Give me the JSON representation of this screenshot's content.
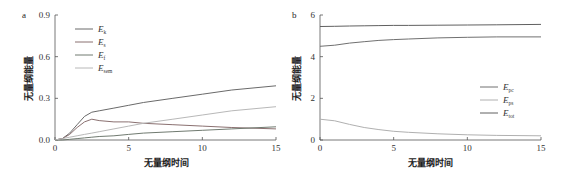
{
  "chart_data": [
    {
      "panel": "a",
      "type": "line",
      "title": "",
      "xlabel": "无量纲时间",
      "ylabel": "无量纲能量",
      "xlim": [
        0,
        15
      ],
      "ylim": [
        0,
        0.9
      ],
      "xticks": [
        "0",
        "5",
        "10",
        "15"
      ],
      "yticks": [
        "0.0",
        "0.3",
        "0.6",
        "0.9"
      ],
      "grid": false,
      "legend_position": "upper-left-inside",
      "x": [
        0,
        0.5,
        1,
        1.5,
        2,
        2.5,
        3,
        4,
        5,
        6,
        8,
        10,
        12,
        15
      ],
      "series": [
        {
          "name": "E_k",
          "label_main": "E",
          "label_sub": "k",
          "color": "#6a6a6a",
          "values": [
            0,
            0.01,
            0.05,
            0.11,
            0.17,
            0.2,
            0.21,
            0.23,
            0.25,
            0.27,
            0.3,
            0.33,
            0.36,
            0.39
          ]
        },
        {
          "name": "E_s",
          "label_main": "E",
          "label_sub": "s",
          "color": "#8a7070",
          "values": [
            0,
            0.01,
            0.04,
            0.09,
            0.13,
            0.15,
            0.14,
            0.13,
            0.13,
            0.12,
            0.11,
            0.1,
            0.09,
            0.08
          ]
        },
        {
          "name": "E_f",
          "label_main": "E",
          "label_sub": "f",
          "color": "#707a70",
          "values": [
            0,
            0.0,
            0.005,
            0.01,
            0.015,
            0.02,
            0.025,
            0.03,
            0.04,
            0.05,
            0.06,
            0.07,
            0.08,
            0.095
          ]
        },
        {
          "name": "E_sem",
          "label_main": "E",
          "label_sub": "sem",
          "color": "#b8b8b8",
          "values": [
            0,
            0.01,
            0.02,
            0.03,
            0.04,
            0.05,
            0.06,
            0.08,
            0.1,
            0.12,
            0.15,
            0.18,
            0.21,
            0.24
          ]
        }
      ]
    },
    {
      "panel": "b",
      "type": "line",
      "title": "",
      "xlabel": "无量纲时间",
      "ylabel": "无量纲能量",
      "xlim": [
        0,
        15
      ],
      "ylim": [
        0,
        6
      ],
      "xticks": [
        "0",
        "5",
        "10",
        "15"
      ],
      "yticks": [
        "0",
        "2",
        "4",
        "6"
      ],
      "grid": false,
      "legend_position": "lower-right-inside",
      "x": [
        0,
        1,
        2,
        3,
        4,
        5,
        6,
        8,
        10,
        12,
        15
      ],
      "series": [
        {
          "name": "E_pc",
          "label_main": "E",
          "label_sub": "pc",
          "color": "#707070",
          "values": [
            4.5,
            4.55,
            4.65,
            4.72,
            4.78,
            4.82,
            4.85,
            4.9,
            4.93,
            4.95,
            4.95
          ]
        },
        {
          "name": "E_ps",
          "label_main": "E",
          "label_sub": "ps",
          "color": "#b0b0b0",
          "values": [
            1.0,
            0.92,
            0.75,
            0.6,
            0.5,
            0.42,
            0.37,
            0.3,
            0.25,
            0.22,
            0.2
          ]
        },
        {
          "name": "E_tot",
          "label_main": "E",
          "label_sub": "tot",
          "color": "#606060",
          "values": [
            5.45,
            5.46,
            5.47,
            5.48,
            5.49,
            5.5,
            5.5,
            5.51,
            5.52,
            5.53,
            5.55
          ]
        }
      ]
    }
  ]
}
